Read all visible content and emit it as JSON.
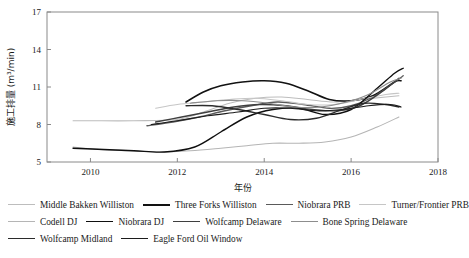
{
  "chart_data": {
    "type": "line",
    "title": "",
    "xlabel": "年份",
    "ylabel": "施工排量 (m³/min)",
    "xlim": [
      2009,
      2018
    ],
    "ylim": [
      5,
      17
    ],
    "xticks": [
      2010,
      2012,
      2014,
      2016,
      2018
    ],
    "yticks": [
      5,
      8,
      11,
      14,
      17
    ],
    "grid": false,
    "legend_position": "bottom",
    "x": [
      2009.5,
      2010,
      2010.5,
      2011,
      2011.5,
      2012,
      2012.5,
      2013,
      2013.5,
      2014,
      2014.5,
      2015,
      2015.5,
      2016,
      2016.5,
      2017
    ],
    "series": [
      {
        "name": "Middle Bakken Williston",
        "color": "#bdbdbd",
        "width": 1.1,
        "x": [
          2009.6,
          2010,
          2011,
          2012,
          2012.6,
          2013.2,
          2013.8,
          2014.4,
          2015,
          2015.6,
          2016.2,
          2016.8,
          2017.1
        ],
        "values": [
          8.3,
          8.3,
          8.3,
          8.4,
          9.0,
          9.7,
          10.1,
          10.2,
          10.0,
          9.8,
          10.0,
          10.2,
          10.3
        ]
      },
      {
        "name": "Three Forks Williston",
        "color": "#121212",
        "width": 1.6,
        "x": [
          2012.2,
          2012.6,
          2013.0,
          2013.5,
          2014.0,
          2014.5,
          2015.0,
          2015.5,
          2016.0,
          2016.5,
          2017.0,
          2017.15
        ],
        "values": [
          9.8,
          10.6,
          11.1,
          11.4,
          11.5,
          11.3,
          10.7,
          10.0,
          9.9,
          10.3,
          11.4,
          11.5
        ]
      },
      {
        "name": "Niobrara PRB",
        "color": "#5a5a5a",
        "width": 1.3,
        "x": [
          2011.3,
          2011.9,
          2012.5,
          2013.1,
          2013.7,
          2014.3,
          2014.9,
          2015.5,
          2016.0,
          2016.5,
          2017.0,
          2017.2
        ],
        "values": [
          7.9,
          8.2,
          8.6,
          9.1,
          9.5,
          9.8,
          9.6,
          9.3,
          9.5,
          10.2,
          11.4,
          11.9
        ]
      },
      {
        "name": "Turner/Frontier PRB",
        "color": "#c6c6c6",
        "width": 1.1,
        "x": [
          2011.5,
          2012.0,
          2012.6,
          2013.2,
          2013.8,
          2014.4,
          2015.0,
          2015.6,
          2016.2,
          2016.8,
          2017.1
        ],
        "values": [
          9.3,
          9.6,
          9.8,
          10.0,
          10.1,
          9.9,
          9.6,
          9.6,
          10.0,
          10.4,
          10.5
        ]
      },
      {
        "name": "Codell DJ",
        "color": "#b5b5b5",
        "width": 1.1,
        "x": [
          2009.6,
          2010.2,
          2010.9,
          2011.6,
          2012.3,
          2013.0,
          2013.6,
          2014.2,
          2014.8,
          2015.4,
          2016.0,
          2016.6,
          2017.1
        ],
        "values": [
          6.2,
          6.0,
          5.9,
          5.8,
          5.9,
          6.1,
          6.3,
          6.5,
          6.5,
          6.6,
          7.0,
          7.8,
          8.6
        ]
      },
      {
        "name": "Niobrara DJ",
        "color": "#0f0f0f",
        "width": 1.4,
        "x": [
          2009.6,
          2010.3,
          2011.0,
          2011.7,
          2012.4,
          2013.0,
          2013.6,
          2014.2,
          2014.8,
          2015.4,
          2016.0,
          2016.6,
          2017.0,
          2017.2
        ],
        "values": [
          6.1,
          6.0,
          5.9,
          5.8,
          6.2,
          7.4,
          8.6,
          9.2,
          9.3,
          8.8,
          9.2,
          10.9,
          12.1,
          12.5
        ]
      },
      {
        "name": "Wolfcamp Delaware",
        "color": "#3f3f3f",
        "width": 1.4,
        "x": [
          2011.5,
          2012.1,
          2012.7,
          2013.3,
          2013.9,
          2014.5,
          2015.1,
          2015.7,
          2016.2,
          2016.7,
          2017.1
        ],
        "values": [
          8.2,
          8.6,
          9.0,
          9.4,
          9.6,
          9.5,
          9.2,
          9.1,
          9.5,
          10.6,
          11.7
        ]
      },
      {
        "name": "Bone Spring Delaware",
        "color": "#8d8d8d",
        "width": 1.2,
        "x": [
          2012.3,
          2012.9,
          2013.5,
          2014.1,
          2014.7,
          2015.3,
          2015.9,
          2016.4,
          2016.9,
          2017.15
        ],
        "values": [
          9.7,
          9.9,
          9.9,
          9.7,
          9.4,
          9.4,
          9.8,
          10.4,
          11.4,
          11.7
        ]
      },
      {
        "name": "Wolfcamp Midland",
        "color": "#2b2b2b",
        "width": 1.3,
        "x": [
          2012.2,
          2012.8,
          2013.4,
          2014.0,
          2014.6,
          2015.2,
          2015.8,
          2016.3,
          2016.8,
          2017.1
        ],
        "values": [
          9.5,
          9.5,
          9.2,
          8.8,
          8.4,
          8.5,
          9.2,
          9.7,
          9.6,
          9.4
        ]
      },
      {
        "name": "Eagle Ford Oil Window",
        "color": "#1c1c1c",
        "width": 1.2,
        "x": [
          2011.4,
          2012.0,
          2012.7,
          2013.4,
          2014.0,
          2014.6,
          2015.2,
          2015.8,
          2016.4,
          2016.9,
          2017.15
        ],
        "values": [
          8.0,
          8.3,
          8.7,
          9.0,
          9.3,
          9.3,
          9.1,
          9.2,
          9.5,
          9.6,
          9.4
        ]
      }
    ]
  },
  "legend": {
    "rows": [
      [
        {
          "label": "Middle Bakken Williston",
          "color": "#bdbdbd",
          "width": 1.1
        },
        {
          "label": "Three Forks Williston",
          "color": "#121212",
          "width": 2.0
        },
        {
          "label": "Niobrara PRB",
          "color": "#5a5a5a",
          "width": 1.5
        },
        {
          "label": "Turner/Frontier PRB",
          "color": "#c6c6c6",
          "width": 1.1
        }
      ],
      [
        {
          "label": "Codell DJ",
          "color": "#b5b5b5",
          "width": 1.1
        },
        {
          "label": "Niobrara DJ",
          "color": "#0f0f0f",
          "width": 1.8
        },
        {
          "label": "Wolfcamp Delaware",
          "color": "#3f3f3f",
          "width": 1.6
        },
        {
          "label": "Bone Spring Delaware",
          "color": "#8d8d8d",
          "width": 1.3
        }
      ],
      [
        {
          "label": "Wolfcamp Midland",
          "color": "#2b2b2b",
          "width": 1.6
        },
        {
          "label": "Eagle Ford Oil Window",
          "color": "#1c1c1c",
          "width": 1.5
        }
      ]
    ]
  }
}
